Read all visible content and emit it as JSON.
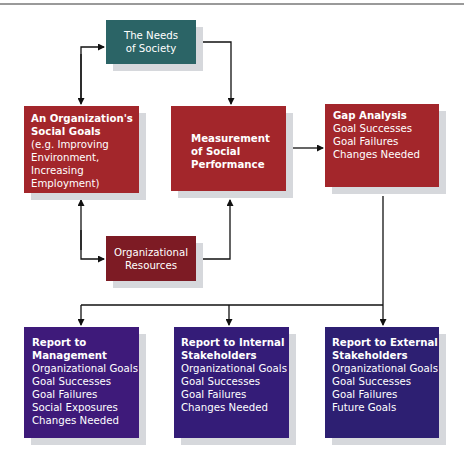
{
  "diagram": {
    "nodes": {
      "needs": {
        "lines": [
          "The Needs",
          "of Society"
        ]
      },
      "goals": {
        "title": [
          "An Organization's",
          "Social Goals"
        ],
        "lines": [
          "(e.g. Improving",
          "Environment,",
          "Increasing",
          "Employment)"
        ]
      },
      "measurement": {
        "title": [
          "Measurement",
          "of Social",
          "Performance"
        ]
      },
      "gap": {
        "title": "Gap Analysis",
        "lines": [
          "Goal Successes",
          "Goal Failures",
          "Changes Needed"
        ]
      },
      "resources": {
        "lines": [
          "Organizational",
          "Resources"
        ]
      },
      "report_management": {
        "title": [
          "Report to",
          "Management"
        ],
        "lines": [
          "Organizational Goals",
          "Goal Successes",
          "Goal Failures",
          "Social Exposures",
          "Changes Needed"
        ]
      },
      "report_internal": {
        "title": [
          "Report to Internal",
          "Stakeholders"
        ],
        "lines": [
          "Organizational Goals",
          "Goal Successes",
          "Goal Failures",
          "Changes Needed"
        ]
      },
      "report_external": {
        "title": [
          "Report to External",
          "Stakeholders"
        ],
        "lines": [
          "Organizational Goals",
          "Goal Successes",
          "Goal Failures",
          "Future Goals"
        ]
      }
    },
    "edges": [
      {
        "from": "goals",
        "to": "needs"
      },
      {
        "from": "needs",
        "to": "measurement"
      },
      {
        "from": "measurement",
        "to": "gap"
      },
      {
        "from": "goals",
        "to": "resources"
      },
      {
        "from": "resources",
        "to": "goals"
      },
      {
        "from": "resources",
        "to": "measurement"
      },
      {
        "from": "gap",
        "to": "report_management"
      },
      {
        "from": "gap",
        "to": "report_internal"
      },
      {
        "from": "gap",
        "to": "report_external"
      }
    ],
    "colors": {
      "teal": "#2b6466",
      "red": "#a3262b",
      "maroon": "#7d1b24",
      "purple": "#3e1a7a",
      "shadow": "#d6d8dc"
    }
  }
}
